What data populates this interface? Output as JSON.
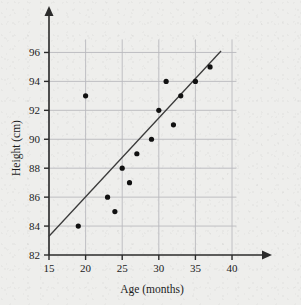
{
  "chart_data": {
    "type": "scatter",
    "title": "",
    "xlabel": "Age (months)",
    "ylabel": "Height (cm)",
    "xlim": [
      15,
      41.5
    ],
    "ylim": [
      82,
      97
    ],
    "xticks": [
      15,
      20,
      25,
      30,
      35,
      40
    ],
    "xtick_labels": [
      "15",
      "20",
      "25",
      "30",
      "35",
      "40"
    ],
    "yticks": [
      82,
      84,
      86,
      88,
      90,
      92,
      94,
      96
    ],
    "ytick_labels": [
      "82",
      "84",
      "86",
      "88",
      "90",
      "92",
      "94",
      "96"
    ],
    "grid": true,
    "legend": null,
    "series": [
      {
        "name": "Age vs Height",
        "marker": "filled-circle",
        "color": "#111111",
        "points": [
          {
            "x": 19,
            "y": 84
          },
          {
            "x": 20,
            "y": 93
          },
          {
            "x": 23,
            "y": 86
          },
          {
            "x": 24,
            "y": 85
          },
          {
            "x": 25,
            "y": 88
          },
          {
            "x": 26,
            "y": 87
          },
          {
            "x": 27,
            "y": 89
          },
          {
            "x": 29,
            "y": 90
          },
          {
            "x": 30,
            "y": 92
          },
          {
            "x": 31,
            "y": 94
          },
          {
            "x": 32,
            "y": 91
          },
          {
            "x": 33,
            "y": 93
          },
          {
            "x": 35,
            "y": 94
          },
          {
            "x": 37,
            "y": 95
          }
        ]
      }
    ],
    "trend_line": {
      "name": "line of best fit",
      "color": "#3a3a3a",
      "x_start": 15,
      "y_start": 83.3,
      "x_end": 38.5,
      "y_end": 96.1
    },
    "annotations": [],
    "axis_arrows": {
      "x_axis": "arrow-right",
      "y_axis": "arrow-up"
    }
  },
  "colors": {
    "background": "#eeeeec",
    "grid": "#b9b9bd",
    "axis": "#2b2b2b",
    "marker": "#111111",
    "trend": "#3a3a3a"
  }
}
